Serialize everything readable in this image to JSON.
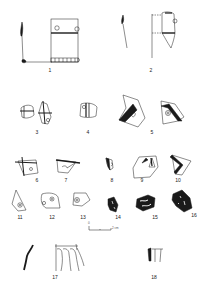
{
  "figure": {
    "type": "archaeological pottery sherd plate",
    "background": "#ffffff",
    "ink": "#1a1a1a"
  },
  "labels": [
    {
      "id": "1",
      "text": "1",
      "x": 50,
      "y": 68
    },
    {
      "id": "2",
      "text": "2",
      "x": 151,
      "y": 68
    },
    {
      "id": "3",
      "text": "3",
      "x": 37,
      "y": 130
    },
    {
      "id": "4",
      "text": "4",
      "x": 88,
      "y": 130
    },
    {
      "id": "5",
      "text": "5",
      "x": 152,
      "y": 130
    },
    {
      "id": "6",
      "text": "6",
      "x": 37,
      "y": 178
    },
    {
      "id": "7",
      "text": "7",
      "x": 66,
      "y": 178
    },
    {
      "id": "8",
      "text": "8",
      "x": 112,
      "y": 178
    },
    {
      "id": "9",
      "text": "9",
      "x": 142,
      "y": 178
    },
    {
      "id": "10",
      "text": "10",
      "x": 178,
      "y": 178
    },
    {
      "id": "11",
      "text": "11",
      "x": 20,
      "y": 215
    },
    {
      "id": "12",
      "text": "12",
      "x": 52,
      "y": 215
    },
    {
      "id": "13",
      "text": "13",
      "x": 83,
      "y": 215
    },
    {
      "id": "14",
      "text": "14",
      "x": 118,
      "y": 215
    },
    {
      "id": "15",
      "text": "15",
      "x": 155,
      "y": 215
    },
    {
      "id": "16",
      "text": "16",
      "x": 194,
      "y": 213
    },
    {
      "id": "17",
      "text": "17",
      "x": 55,
      "y": 275
    },
    {
      "id": "18",
      "text": "18",
      "x": 154,
      "y": 275
    }
  ],
  "scale_bar": {
    "start_label": "0",
    "end_label": "2 cm"
  }
}
